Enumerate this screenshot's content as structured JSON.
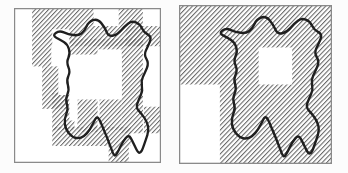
{
  "figure": {
    "background": "#fcfcfc",
    "panel_fill": "#ffffff",
    "border_color": "#8a8a8a",
    "border_width": 1.2,
    "units": 146,
    "hatch": {
      "color": "#676767",
      "spacing": 3.1,
      "line_width": 1.0,
      "direction": "diagonal-up-right"
    },
    "outline": {
      "color": "#1f1f1f",
      "width": 2.3
    },
    "panels": [
      {
        "id": "left",
        "name": "boundary-band-panel",
        "x": 14,
        "y": 8,
        "width": 147,
        "height": 155,
        "hatch_rects": [
          [
            18,
            0,
            61,
            17
          ],
          [
            104,
            0,
            24,
            17
          ],
          [
            18,
            17,
            19,
            38
          ],
          [
            37,
            17,
            91,
            19
          ],
          [
            55,
            29,
            28,
            15
          ],
          [
            83,
            29,
            24,
            10
          ],
          [
            111,
            17,
            35,
            19
          ],
          [
            107,
            29,
            21,
            89
          ],
          [
            28,
            55,
            26,
            40
          ],
          [
            38,
            80,
            22,
            35
          ],
          [
            63,
            86,
            20,
            31
          ],
          [
            85,
            86,
            22,
            29
          ],
          [
            38,
            112,
            78,
            18
          ],
          [
            94,
            130,
            20,
            16
          ],
          [
            129,
            93,
            17,
            25
          ]
        ],
        "white_rects": [
          [
            38,
            20,
            17,
            24
          ],
          [
            44,
            44,
            11,
            38
          ],
          [
            55,
            44,
            52,
            42
          ],
          [
            55,
            82,
            8,
            24
          ]
        ]
      },
      {
        "id": "right",
        "name": "full-cover-panel",
        "x": 179,
        "y": 5,
        "width": 153,
        "height": 159,
        "hatch_rects": [
          [
            0,
            0,
            146,
            146
          ]
        ],
        "white_rects": [
          [
            0,
            73,
            39,
            73
          ],
          [
            76,
            39,
            32,
            34
          ]
        ]
      }
    ],
    "region_outline_points": [
      [
        38,
        26
      ],
      [
        45,
        21
      ],
      [
        54,
        25
      ],
      [
        64,
        26
      ],
      [
        70,
        22
      ],
      [
        74,
        13
      ],
      [
        83,
        10
      ],
      [
        90,
        18
      ],
      [
        94,
        27
      ],
      [
        103,
        25
      ],
      [
        110,
        17
      ],
      [
        117,
        12
      ],
      [
        125,
        15
      ],
      [
        129,
        23
      ],
      [
        137,
        27
      ],
      [
        133,
        36
      ],
      [
        129,
        44
      ],
      [
        134,
        52
      ],
      [
        130,
        61
      ],
      [
        126,
        69
      ],
      [
        128,
        78
      ],
      [
        124,
        86
      ],
      [
        121,
        94
      ],
      [
        127,
        100
      ],
      [
        132,
        107
      ],
      [
        134,
        115
      ],
      [
        131,
        124
      ],
      [
        125,
        140
      ],
      [
        118,
        126
      ],
      [
        114,
        119
      ],
      [
        108,
        126
      ],
      [
        104,
        134
      ],
      [
        100,
        141
      ],
      [
        96,
        131
      ],
      [
        92,
        121
      ],
      [
        88,
        112
      ],
      [
        85,
        105
      ],
      [
        82,
        102
      ],
      [
        78,
        110
      ],
      [
        73,
        118
      ],
      [
        66,
        123
      ],
      [
        58,
        122
      ],
      [
        51,
        114
      ],
      [
        50,
        104
      ],
      [
        54,
        95
      ],
      [
        51,
        86
      ],
      [
        55,
        77
      ],
      [
        52,
        68
      ],
      [
        56,
        60
      ],
      [
        52,
        51
      ],
      [
        56,
        43
      ],
      [
        53,
        34
      ],
      [
        46,
        30
      ]
    ]
  }
}
